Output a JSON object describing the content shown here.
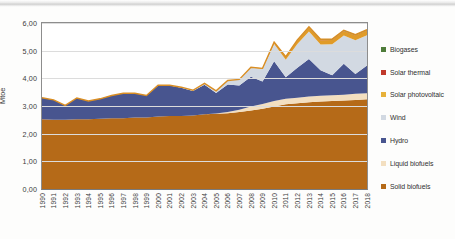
{
  "chart_data": {
    "type": "area",
    "stacked": true,
    "title": "",
    "xlabel": "",
    "ylabel": "Mtoe",
    "ylim": [
      0,
      6
    ],
    "ytick_labels": [
      "6,00",
      "5,00",
      "4,00",
      "3,00",
      "2,00",
      "1,00",
      "0,00"
    ],
    "ytick_values": [
      6,
      5,
      4,
      3,
      2,
      1,
      0
    ],
    "grid": true,
    "legend_position": "right",
    "decimal_separator": ",",
    "categories": [
      "1990",
      "1991",
      "1992",
      "1993",
      "1994",
      "1995",
      "1996",
      "1997",
      "1998",
      "1999",
      "2000",
      "2001",
      "2002",
      "2003",
      "2004",
      "2005",
      "2006",
      "2007",
      "2008",
      "2009",
      "2010",
      "2011",
      "2012",
      "2013",
      "2014",
      "2015",
      "2016",
      "2017",
      "2018"
    ],
    "stack_order_bottom_to_top": [
      "Solid biofuels",
      "Liquid biofuels",
      "Hydro",
      "Wind",
      "Solar photovoltaic",
      "Solar thermal",
      "Biogases"
    ],
    "series": [
      {
        "name": "Biogases",
        "color": "#4E7C3A",
        "values": [
          0,
          0,
          0,
          0,
          0,
          0,
          0,
          0,
          0,
          0,
          0,
          0,
          0,
          0,
          0,
          0,
          0,
          0,
          0,
          0,
          0.01,
          0.01,
          0.01,
          0.01,
          0.02,
          0.02,
          0.02,
          0.02,
          0.02
        ]
      },
      {
        "name": "Solar thermal",
        "color": "#C0392B",
        "values": [
          0,
          0,
          0,
          0,
          0,
          0,
          0,
          0,
          0,
          0,
          0,
          0,
          0,
          0,
          0,
          0,
          0,
          0,
          0,
          0,
          0.01,
          0.01,
          0.01,
          0.01,
          0.01,
          0.01,
          0.01,
          0.01,
          0.01
        ]
      },
      {
        "name": "Solar photovoltaic",
        "color": "#E09B28",
        "values": [
          0,
          0,
          0,
          0,
          0,
          0,
          0,
          0,
          0,
          0,
          0,
          0,
          0,
          0,
          0,
          0,
          0,
          0,
          0.01,
          0.02,
          0.05,
          0.09,
          0.13,
          0.15,
          0.16,
          0.16,
          0.16,
          0.17,
          0.17
        ]
      },
      {
        "name": "Wind",
        "color": "#D2D9E2",
        "values": [
          0,
          0,
          0,
          0,
          0,
          0,
          0,
          0,
          0,
          0,
          0.01,
          0.01,
          0.02,
          0.03,
          0.05,
          0.08,
          0.14,
          0.22,
          0.33,
          0.45,
          0.62,
          0.63,
          0.86,
          0.99,
          0.93,
          1.12,
          1.02,
          1.22,
          1.1
        ]
      },
      {
        "name": "Hydro",
        "color": "#48558F",
        "values": [
          0.78,
          0.72,
          0.52,
          0.77,
          0.66,
          0.72,
          0.82,
          0.9,
          0.88,
          0.8,
          1.12,
          1.1,
          1.02,
          0.88,
          1.07,
          0.74,
          1.0,
          0.88,
          1.08,
          0.82,
          1.44,
          0.78,
          1.08,
          1.36,
          0.92,
          0.72,
          1.12,
          0.72,
          1.0
        ]
      },
      {
        "name": "Liquid biofuels",
        "color": "#F3DFC0",
        "values": [
          0,
          0,
          0,
          0,
          0,
          0,
          0,
          0,
          0,
          0,
          0,
          0,
          0,
          0,
          0,
          0.01,
          0.04,
          0.08,
          0.14,
          0.17,
          0.2,
          0.2,
          0.2,
          0.2,
          0.21,
          0.21,
          0.21,
          0.22,
          0.22
        ]
      },
      {
        "name": "Solid biofuels",
        "color": "#B56A18",
        "values": [
          2.52,
          2.5,
          2.5,
          2.52,
          2.52,
          2.54,
          2.56,
          2.56,
          2.58,
          2.58,
          2.62,
          2.64,
          2.64,
          2.66,
          2.7,
          2.72,
          2.74,
          2.78,
          2.84,
          2.9,
          2.98,
          3.06,
          3.1,
          3.14,
          3.16,
          3.18,
          3.2,
          3.22,
          3.24
        ]
      }
    ],
    "legend_top_to_bottom": [
      {
        "label": "Biogases",
        "color": "#4E7C3A"
      },
      {
        "label": "Solar thermal",
        "color": "#C0392B"
      },
      {
        "label": "Solar photovoltaic",
        "color": "#E7B13A"
      },
      {
        "label": "Wind",
        "color": "#D2D9E2"
      },
      {
        "label": "Hydro",
        "color": "#48558F"
      },
      {
        "label": "Liquid biofuels",
        "color": "#F3DFC0"
      },
      {
        "label": "Solid biofuels",
        "color": "#B56A18"
      }
    ]
  }
}
